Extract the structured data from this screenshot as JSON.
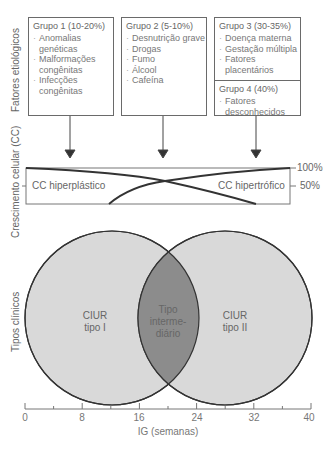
{
  "y_axis_labels": {
    "etiology": "Fatores etiológicos",
    "cell_growth": "Crescimento celular (CC)",
    "clinical_types": "Tipos clínicos"
  },
  "groups": [
    {
      "title": "Grupo 1 (10-20%)",
      "items": [
        "Anomalias genéticas",
        "Malformações congênitas",
        "Infecções congênitas"
      ]
    },
    {
      "title": "Grupo 2 (5-10%)",
      "items": [
        "Desnutrição grave",
        "Drogas",
        "Fumo",
        "Álcool",
        "Cafeína"
      ]
    },
    {
      "title": "Grupo 3 (30-35%)",
      "items": [
        "Doença materna",
        "Gestação múltipla",
        "Fatores placentários"
      ]
    },
    {
      "title": "Grupo 4 (40%)",
      "items": [
        "Fatores desconhecidos"
      ]
    }
  ],
  "cell_growth": {
    "left_label": "CC hiperplástico",
    "right_label": "CC hipertrófico",
    "pct_100": "100%",
    "pct_50": "50%"
  },
  "clinical_types": {
    "type1_line1": "CIUR",
    "type1_line2": "tipo I",
    "intermediate_line1": "Tipo",
    "intermediate_line2": "interme-",
    "intermediate_line3": "diário",
    "type2_line1": "CIUR",
    "type2_line2": "tipo II"
  },
  "x_axis": {
    "label": "IG (semanas)",
    "ticks": [
      "0",
      "8",
      "16",
      "24",
      "32",
      "40"
    ]
  },
  "colors": {
    "line": "#3a3a3a",
    "circle_fill": "#d9d9d9",
    "overlap_fill": "#8c8c8c",
    "box_border": "#6a6a6a"
  }
}
